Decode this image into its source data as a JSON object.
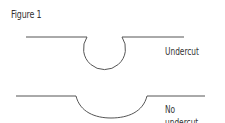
{
  "figure": {
    "title": "Figure 1",
    "diagrams": [
      {
        "label": "Undercut",
        "shape": "circular recess with narrow opening"
      },
      {
        "label": "No undercut",
        "shape": "shallow rounded recess"
      }
    ],
    "stroke_color": "#555555"
  }
}
